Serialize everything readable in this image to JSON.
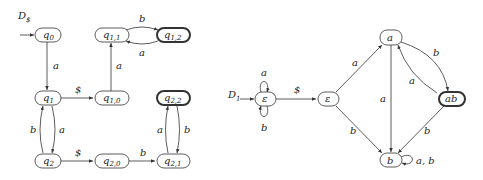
{
  "left_diagram": {
    "title": "D",
    "title_sub": "$",
    "nodes": {
      "q0": {
        "label": "q",
        "sub": "0"
      },
      "q1": {
        "label": "q",
        "sub": "1"
      },
      "q2": {
        "label": "q",
        "sub": "2"
      },
      "q10": {
        "label": "q",
        "sub": "1,0"
      },
      "q11": {
        "label": "q",
        "sub": "1,1"
      },
      "q12": {
        "label": "q",
        "sub": "1,2"
      },
      "q20": {
        "label": "q",
        "sub": "2,0"
      },
      "q21": {
        "label": "q",
        "sub": "2,1"
      },
      "q22": {
        "label": "q",
        "sub": "2,2"
      }
    },
    "edges": {
      "q0_q1": "a",
      "q1_q10": "$",
      "q10_q11": "a",
      "q11_q12": "b",
      "q12_q11": "a",
      "q1_q2": "a",
      "q2_q1": "b",
      "q2_q20": "$",
      "q20_q21": "b",
      "q21_q22": "a",
      "q22_q21": "b"
    },
    "accepting": [
      "q1,2",
      "q2,2"
    ]
  },
  "right_diagram": {
    "title": "D",
    "title_sub": "1",
    "nodes": {
      "eps1": "ε",
      "eps2": "ε",
      "a": "a",
      "ab": "ab",
      "b": "b"
    },
    "edges": {
      "eps1_loop_top": "a",
      "eps1_loop_bottom": "b",
      "eps1_eps2": "$",
      "eps2_a": "a",
      "eps2_b": "b",
      "a_b": "a",
      "a_ab": "b",
      "ab_a": "a",
      "ab_b": "b",
      "b_loop": "a, b"
    },
    "accepting": [
      "ab"
    ]
  }
}
